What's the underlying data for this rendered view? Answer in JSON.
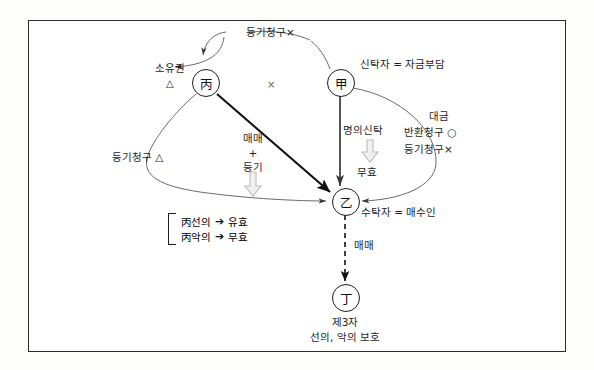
{
  "diagram": {
    "type": "legal-relationship-diagram",
    "title_present": false,
    "nodes": [
      {
        "id": "byeong",
        "glyph": "丙",
        "x": 205,
        "y": 82
      },
      {
        "id": "gap",
        "glyph": "甲",
        "x": 340,
        "y": 82
      },
      {
        "id": "eul",
        "glyph": "乙",
        "x": 345,
        "y": 201
      },
      {
        "id": "jeong",
        "glyph": "丁",
        "x": 345,
        "y": 297
      }
    ],
    "labels": {
      "top_registration_claim": "등기청구×",
      "ownership": "소유권",
      "ownership_mark": "△",
      "center_cross": "×",
      "gap_role": "신탁자 = 자금부담",
      "price_line1": "대금",
      "price_line2": "반환청구 ○",
      "price_line3": "등기청구×",
      "title_trust": "명의신탁",
      "title_trust_result": "무효",
      "sale_line1": "매매",
      "sale_plus": "+",
      "sale_line2": "등기",
      "left_registration_claim": "등기청구 △",
      "eul_role": "수탁자 = 매수인",
      "eul_to_jeong": "매매",
      "jeong_role": "제3자",
      "jeong_protection": "선의, 악의 보호"
    },
    "bracket_rules": [
      {
        "condition": "丙선의",
        "arrow": "➔",
        "result": "유효"
      },
      {
        "condition": "丙악의",
        "arrow": "➔",
        "result": "무효"
      }
    ],
    "colors": {
      "frame": "#2b2b2b",
      "ink": "#1d1d1d",
      "line": "#555555",
      "hollow_arrow": "#b8b8b8",
      "background": "#ffffff"
    }
  }
}
